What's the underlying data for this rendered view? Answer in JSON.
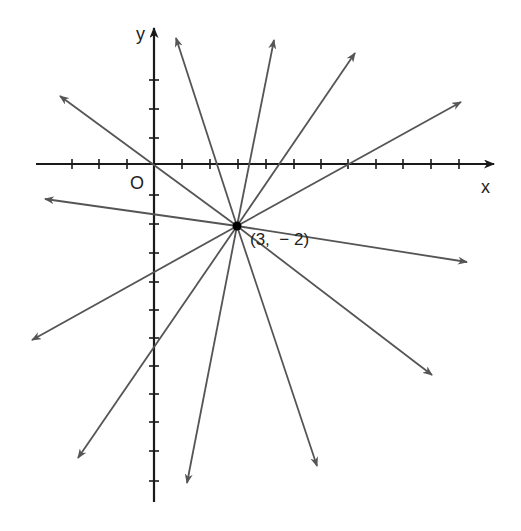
{
  "diagram": {
    "title": "",
    "axis_x_label": "x",
    "axis_y_label": "y",
    "origin_label": "O",
    "point_label": "(3,  − 2)",
    "point": {
      "x": 3,
      "y": -2
    },
    "line_count": 6,
    "colors": {
      "axes": "#1a1a1a",
      "lines": "#555555",
      "point": "#000000"
    },
    "x_ticks": [
      -5,
      -4,
      -3,
      -2,
      -1,
      1,
      2,
      3,
      4,
      5,
      6,
      7,
      8,
      9,
      10,
      11,
      12
    ],
    "y_ticks": [
      3,
      2,
      1,
      -1,
      -2,
      -3,
      -4,
      -5,
      -6,
      -7,
      -8,
      -9,
      -10,
      -11,
      -12
    ]
  }
}
